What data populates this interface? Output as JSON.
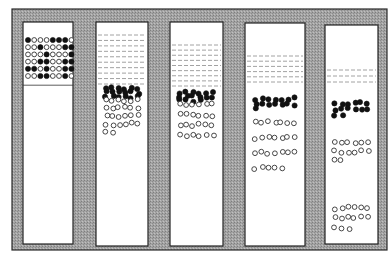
{
  "figure": {
    "type": "sedimentation-sequence",
    "frame": {
      "x": 12,
      "y": 9,
      "w": 375,
      "h": 241,
      "fill": "#9a9a9a",
      "stroke": "#2a2a2a"
    },
    "colors": {
      "tube": "#ffffff",
      "filled": "#111111",
      "open_stroke": "#333333",
      "dash": "#8a8a8a"
    },
    "tubes": [
      {
        "id": 1,
        "x": 23,
        "y": 22,
        "w": 50,
        "h": 222,
        "liquid": null,
        "mixed_grid": {
          "top": 40,
          "rows": 6,
          "cols": 8,
          "dx": 6.2,
          "dy": 7.2,
          "pattern": [
            "10001110",
            "00100011",
            "00010001",
            "00110011",
            "11010011",
            "00110010"
          ]
        },
        "dark_band": null,
        "light_bands": []
      },
      {
        "id": 2,
        "x": 96,
        "y": 22,
        "w": 52,
        "h": 224,
        "liquid": {
          "top": 35,
          "bottom": 84,
          "lines": 10
        },
        "dark_band": {
          "top": 86,
          "bottom": 99,
          "count": 18
        },
        "light_bands": [
          {
            "top": 96,
            "bottom": 136,
            "count": 26
          }
        ]
      },
      {
        "id": 3,
        "x": 170,
        "y": 22,
        "w": 53,
        "h": 224,
        "liquid": {
          "top": 45,
          "bottom": 86,
          "lines": 9
        },
        "dark_band": {
          "top": 90,
          "bottom": 103,
          "count": 16
        },
        "light_bands": [
          {
            "top": 100,
            "bottom": 140,
            "count": 24
          }
        ]
      },
      {
        "id": 4,
        "x": 245,
        "y": 23,
        "w": 60,
        "h": 223,
        "liquid": {
          "top": 56,
          "bottom": 82,
          "lines": 6
        },
        "dark_band": {
          "top": 96,
          "bottom": 112,
          "count": 15
        },
        "light_bands": [
          {
            "top": 115,
            "bottom": 176,
            "count": 26
          }
        ]
      },
      {
        "id": 5,
        "x": 325,
        "y": 25,
        "w": 53,
        "h": 219,
        "liquid": {
          "top": 70,
          "bottom": 82,
          "lines": 3
        },
        "dark_band": {
          "top": 100,
          "bottom": 118,
          "count": 14
        },
        "light_bands": [
          {
            "top": 138,
            "bottom": 165,
            "count": 14
          },
          {
            "top": 203,
            "bottom": 233,
            "count": 15
          }
        ]
      }
    ]
  }
}
